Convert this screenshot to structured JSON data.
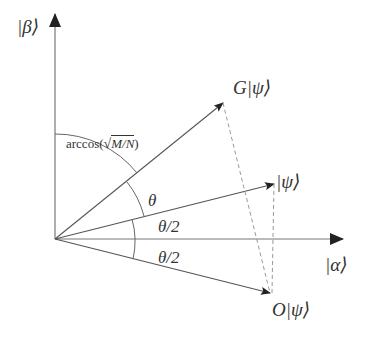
{
  "diagram": {
    "type": "grover-rotation-geometric-diagram",
    "colors": {
      "line": "#555555",
      "dashed": "#888888",
      "text": "#333333",
      "background": "#ffffff"
    },
    "axes": {
      "vertical_label": "|β⟩",
      "horizontal_label": "|α⟩"
    },
    "vectors": [
      {
        "id": "G_psi",
        "label": "G|ψ⟩"
      },
      {
        "id": "psi",
        "label": "|ψ⟩"
      },
      {
        "id": "O_psi",
        "label": "O|ψ⟩"
      }
    ],
    "angles": {
      "arccos_label_prefix": "arccos(",
      "arccos_label_radicand": "M/N",
      "arccos_label_suffix": ")",
      "theta": "θ",
      "theta_half_upper": "θ/2",
      "theta_half_lower": "θ/2"
    }
  }
}
